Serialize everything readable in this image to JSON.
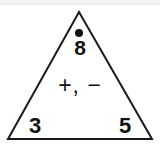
{
  "figure": {
    "kind": "fact-family-triangle",
    "shape_name": "triangle-outline",
    "outline_color": "#1a1a1a",
    "fill_color": "#ffffff",
    "stroke_width": 2,
    "apex": {
      "x": 79,
      "y": 12
    },
    "bottom_left": {
      "x": 8,
      "y": 139
    },
    "bottom_right": {
      "x": 152,
      "y": 139
    }
  },
  "top": {
    "marker": "dot-marker",
    "marker_color": "#111111",
    "value": "8"
  },
  "middle": {
    "operators": "+, −",
    "plus": "+",
    "comma": ",",
    "minus": "−"
  },
  "bottom": {
    "left_value": "3",
    "right_value": "5"
  },
  "page": {
    "background": "#ffffff",
    "top_band_color": "#f2f2f2"
  }
}
